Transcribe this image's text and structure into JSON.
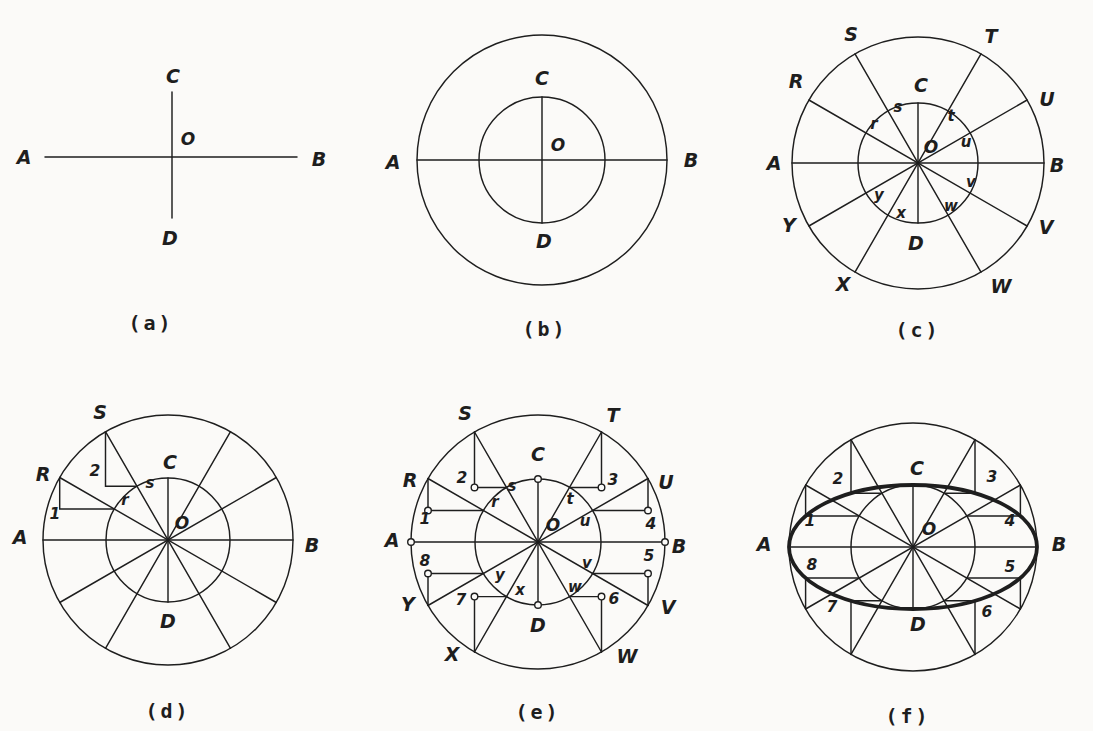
{
  "page": {
    "colors": {
      "paper": "#fbfaf8",
      "ink": "#1e1e1e"
    }
  },
  "figures": {
    "a": {
      "caption": "(a)",
      "labels": {
        "A": "A",
        "B": "B",
        "C": "C",
        "D": "D",
        "O": "O"
      }
    },
    "b": {
      "caption": "(b)",
      "labels": {
        "A": "A",
        "B": "B",
        "C": "C",
        "D": "D",
        "O": "O"
      }
    },
    "c": {
      "caption": "(c)",
      "labels": {
        "A": "A",
        "B": "B",
        "C": "C",
        "D": "D",
        "O": "O",
        "R": "R",
        "S": "S",
        "T": "T",
        "U": "U",
        "V": "V",
        "W": "W",
        "X": "X",
        "Y": "Y",
        "r": "r",
        "s": "s",
        "t": "t",
        "u": "u",
        "v": "v",
        "w": "w",
        "x": "x",
        "y": "y"
      }
    },
    "d": {
      "caption": "(d)",
      "labels": {
        "A": "A",
        "B": "B",
        "C": "C",
        "D": "D",
        "O": "O",
        "R": "R",
        "S": "S",
        "r": "r",
        "s": "s",
        "p1": "1",
        "p2": "2"
      }
    },
    "e": {
      "caption": "(e)",
      "labels": {
        "A": "A",
        "B": "B",
        "C": "C",
        "D": "D",
        "O": "O",
        "R": "R",
        "S": "S",
        "T": "T",
        "U": "U",
        "V": "V",
        "W": "W",
        "X": "X",
        "Y": "Y",
        "r": "r",
        "s": "s",
        "t": "t",
        "u": "u",
        "v": "v",
        "w": "w",
        "x": "x",
        "y": "y",
        "p1": "1",
        "p2": "2",
        "p3": "3",
        "p4": "4",
        "p5": "5",
        "p6": "6",
        "p7": "7",
        "p8": "8"
      }
    },
    "f": {
      "caption": "(f)",
      "labels": {
        "A": "A",
        "B": "B",
        "C": "C",
        "D": "D",
        "O": "O",
        "p1": "1",
        "p2": "2",
        "p3": "3",
        "p4": "4",
        "p5": "5",
        "p6": "6",
        "p7": "7",
        "p8": "8"
      }
    }
  }
}
